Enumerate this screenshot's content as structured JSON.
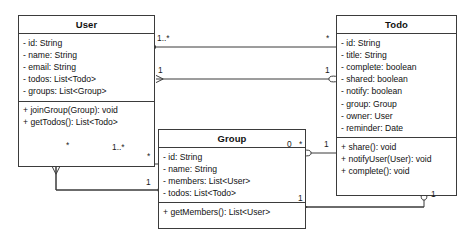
{
  "diagram": {
    "kind": "uml-class-diagram",
    "stroke_color": "#3b3b3b",
    "text_color": "#111111",
    "background": "#ffffff",
    "classes": [
      {
        "id": "user",
        "name": "User",
        "attributes": [
          "- id: String",
          "- name: String",
          "- email: String",
          "- todos: List<Todo>",
          "- groups: List<Group>"
        ],
        "methods": [
          "+ joinGroup(Group): void",
          "+ getTodos(): List<Todo>"
        ]
      },
      {
        "id": "todo",
        "name": "Todo",
        "attributes": [
          "- id: String",
          "- title: String",
          "- complete: boolean",
          "- shared: boolean",
          "- notify: boolean",
          "- group: Group",
          "- owner: User",
          "- reminder: Date"
        ],
        "methods": [
          "+ share(): void",
          "+ notifyUser(User): void",
          "+ complete(): void"
        ]
      },
      {
        "id": "group",
        "name": "Group",
        "attributes": [
          "- id: String",
          "- name: String",
          "- members: List<User>",
          "- todos: List<Todo>"
        ],
        "methods": [
          "+ getMembers(): List<User>"
        ]
      }
    ],
    "multiplicities": {
      "user_todo_top_left": "1..*",
      "user_todo_top_right": "*",
      "todo_user_mid_left": "1",
      "todo_user_mid_right": "1",
      "user_group_left": "*",
      "user_group_diamond": "1..*",
      "group_left_star": "*",
      "group_left_one": "1",
      "group_todo_zero": "0",
      "group_todo_star": "*",
      "group_todo_one": "1",
      "todo_group_bottom": "1",
      "todo_group_bottom_right": "1"
    }
  }
}
